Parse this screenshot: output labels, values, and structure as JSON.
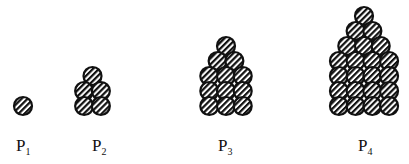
{
  "figure": {
    "patterns": [
      {
        "id": "P1",
        "label": "P",
        "subscript": "1",
        "rows": [
          1
        ],
        "total": 1
      },
      {
        "id": "P2",
        "label": "P",
        "subscript": "2",
        "rows": [
          1,
          2,
          2
        ],
        "total": 5
      },
      {
        "id": "P3",
        "label": "P",
        "subscript": "3",
        "rows": [
          1,
          2,
          3,
          3,
          3
        ],
        "total": 12
      },
      {
        "id": "P4",
        "label": "P",
        "subscript": "4",
        "rows": [
          1,
          2,
          3,
          4,
          4,
          4,
          4
        ],
        "total": 22
      }
    ],
    "colors": {
      "circle_outline": "#111111",
      "hatch": "#111111",
      "fill": "#ffffff"
    }
  }
}
